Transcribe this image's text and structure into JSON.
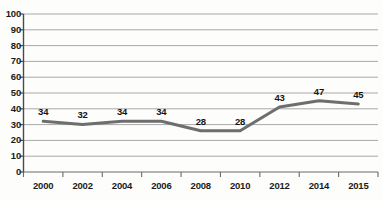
{
  "chart_data": {
    "type": "line",
    "title": "",
    "subtitle": "",
    "xlabel": "",
    "ylabel": "",
    "categories": [
      "2000",
      "2002",
      "2004",
      "2006",
      "2008",
      "2010",
      "2012",
      "2014",
      "2015"
    ],
    "values": [
      34,
      32,
      34,
      34,
      28,
      28,
      43,
      47,
      45
    ],
    "series": [
      {
        "name": "",
        "values": [
          34,
          32,
          34,
          34,
          28,
          28,
          43,
          47,
          45
        ],
        "color": "#6e6e6e",
        "line_width": 3
      }
    ],
    "data_labels": [
      "34",
      "32",
      "34",
      "34",
      "28",
      "28",
      "43",
      "47",
      "45"
    ],
    "data_labels_visible": true,
    "ylim": [
      0,
      100
    ],
    "ytick_step": 10,
    "yticks": [
      "0",
      "10",
      "20",
      "30",
      "40",
      "50",
      "60",
      "70",
      "80",
      "90",
      "100"
    ],
    "xticks": [
      "2000",
      "2002",
      "2004",
      "2006",
      "2008",
      "2010",
      "2012",
      "2014",
      "2015"
    ],
    "grid": true,
    "grid_axis": "y",
    "grid_color": "#a8a8a8",
    "axis_color": "#555555",
    "legend": false,
    "legend_position": "none",
    "markers": false,
    "background_color": "#fdfdfc"
  }
}
